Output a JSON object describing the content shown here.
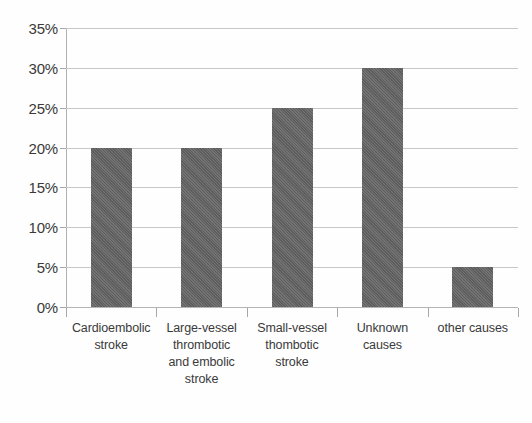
{
  "chart_data": {
    "type": "bar",
    "title": "",
    "subtitle": "",
    "xlabel": "",
    "ylabel": "",
    "legend": [],
    "legend_position": "none",
    "grid": true,
    "ylim": [
      0,
      35
    ],
    "ytick_values": [
      0,
      5,
      10,
      15,
      20,
      25,
      30,
      35
    ],
    "ytick_labels": [
      "0%",
      "5%",
      "10%",
      "15%",
      "20%",
      "25%",
      "30%",
      "35%"
    ],
    "categories": [
      "Cardioembolic stroke",
      "Large-vessel thrombotic and embolic stroke",
      "Small-vessel thombotic stroke",
      "Unknown causes",
      "other causes"
    ],
    "category_label_lines": [
      [
        "Cardioembolic",
        "stroke"
      ],
      [
        "Large-vessel",
        "thrombotic",
        "and embolic",
        "stroke"
      ],
      [
        "Small-vessel",
        "thombotic",
        "stroke"
      ],
      [
        "Unknown",
        "causes"
      ],
      [
        "other causes"
      ]
    ],
    "values": [
      20,
      20,
      25,
      30,
      5
    ],
    "value_labels": [
      "20%",
      "20%",
      "25%",
      "30%",
      "5%"
    ],
    "bar_color": "#636363",
    "gridline_color": "#c8c8c8",
    "axis_color": "#b0b0b0",
    "background_color": "#fefefe",
    "text_color": "#3a3a3a"
  }
}
